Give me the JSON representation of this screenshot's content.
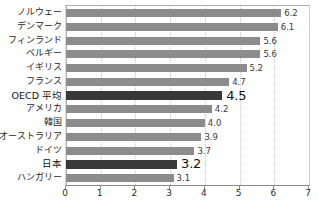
{
  "chart_data": {
    "type": "bar",
    "orientation": "horizontal",
    "title": "",
    "subtitle": "",
    "xlabel": "",
    "ylabel": "",
    "xlim": [
      0,
      7
    ],
    "xticks": [
      "0",
      "1",
      "2",
      "3",
      "4",
      "5",
      "6",
      "7"
    ],
    "grid": true,
    "grid_axis": "x",
    "legend": false,
    "categories": [
      "ノルウェー",
      "デンマーク",
      "フィンランド",
      "ベルギー",
      "イギリス",
      "フランス",
      "OECD 平均",
      "アメリカ",
      "韓国",
      "オーストラリア",
      "ドイツ",
      "日本",
      "ハンガリー"
    ],
    "values": [
      6.2,
      6.1,
      5.6,
      5.6,
      5.2,
      4.7,
      4.5,
      4.2,
      4.0,
      3.9,
      3.7,
      3.2,
      3.1
    ],
    "value_labels": [
      "6.2",
      "6.1",
      "5.6",
      "5.6",
      "5.2",
      "4.7",
      "4.5",
      "4.2",
      "4.0",
      "3.9",
      "3.7",
      "3.2",
      "3.1"
    ],
    "highlighted": [
      false,
      false,
      false,
      false,
      false,
      false,
      true,
      false,
      false,
      false,
      false,
      true,
      false
    ],
    "colors": {
      "bar": "#8c8c8c",
      "bar_highlight": "#383838",
      "grid": "#c9c9c9",
      "axis": "#8a8a8a",
      "text": "#262626"
    }
  }
}
